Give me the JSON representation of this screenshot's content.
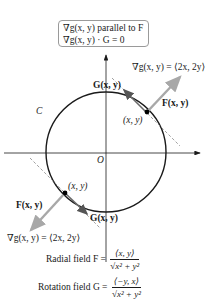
{
  "box": {
    "line1": "∇g(x, y) parallel to F",
    "line2": "∇g(x, y) · G = 0"
  },
  "labels": {
    "curve": "C",
    "origin": "O",
    "grad_top": "∇g(x, y) = ⟨2x, 2y⟩",
    "grad_bottom": "∇g(x, y) = ⟨2x, 2y⟩",
    "F_top": "F(x, y)",
    "F_bottom": "F(x, y)",
    "G_top": "G(x, y)",
    "G_bottom": "G(x, y)",
    "point_top": "(x, y)",
    "point_bottom": "(x, y)"
  },
  "formulas": {
    "radial_label": "Radial field F =",
    "radial_num": "⟨x, y⟩",
    "radial_den": "√x² + y²",
    "rotation_label": "Rotation field G =",
    "rotation_num": "⟨−y, x⟩",
    "rotation_den": "√x² + y²"
  },
  "colors": {
    "ink": "#1a1a1a",
    "arrow_gray": "#a8a8a8",
    "dashed": "#8a8a8a",
    "box_border": "#9a9a9a"
  }
}
